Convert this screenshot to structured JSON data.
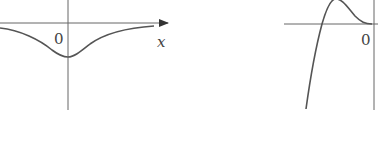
{
  "figures": [
    {
      "id": "left-graph",
      "origin_label": "0",
      "x_axis_label": "x",
      "description": "Bell-shaped curve below x-axis with minimum at origin's y-axis, approaching x-axis asymptotically"
    },
    {
      "id": "right-graph",
      "origin_label": "0",
      "description": "Curve rising steeply from bottom-left, crossing x-axis, peaking above, then touching x-axis at origin"
    }
  ],
  "colors": {
    "stroke": "#555555",
    "background": "#ffffff"
  }
}
